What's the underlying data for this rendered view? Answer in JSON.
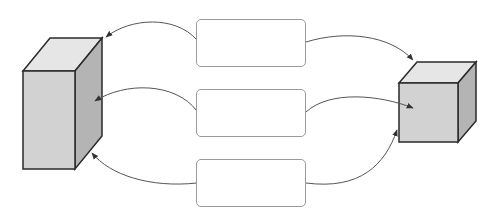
{
  "diagram": {
    "type": "flow",
    "nodes": [
      {
        "id": "left-block",
        "shape": "tall-3d-box",
        "label": ""
      },
      {
        "id": "right-block",
        "shape": "3d-cube",
        "label": ""
      },
      {
        "id": "box-top",
        "shape": "rounded-rect",
        "label": ""
      },
      {
        "id": "box-middle",
        "shape": "rounded-rect",
        "label": ""
      },
      {
        "id": "box-bottom",
        "shape": "rounded-rect",
        "label": ""
      }
    ],
    "edges": [
      {
        "from": "box-top",
        "to": "left-block"
      },
      {
        "from": "box-middle",
        "to": "left-block"
      },
      {
        "from": "box-bottom",
        "to": "left-block"
      },
      {
        "from": "box-top",
        "to": "right-block"
      },
      {
        "from": "box-middle",
        "to": "right-block"
      },
      {
        "from": "box-bottom",
        "to": "right-block"
      }
    ],
    "colors": {
      "front_face": "#d2d2d2",
      "top_face": "#e6e6e6",
      "side_face": "#b4b4b4",
      "outline": "#2a2a2a",
      "box_border": "#9a9a9a",
      "arrow": "#555555"
    }
  }
}
